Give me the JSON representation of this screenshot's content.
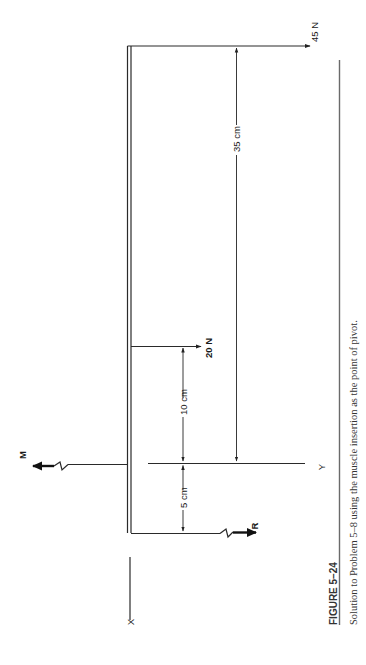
{
  "figure": {
    "number_label": "FIGURE 5–24",
    "caption": "Solution to Problem 5–8 using the muscle insertion as the point of pivot.",
    "orientation": "rotated 90° counter-clockwise"
  },
  "forces": {
    "weight_load": "45 N",
    "segment_weight": "20 N",
    "muscle": "M",
    "reaction": "R"
  },
  "dimensions": {
    "load_distance": "35 cm",
    "segment_distance": "10 cm",
    "reaction_distance": "5 cm"
  },
  "axes": {
    "x_label": "X",
    "y_label": "Y"
  }
}
